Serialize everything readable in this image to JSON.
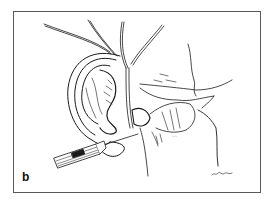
{
  "figure": {
    "panel_label": "b",
    "signature": "artist signature (illegible)",
    "annotation_near_vessels": "small illegible label",
    "colors": {
      "background": "#ffffff",
      "frame_border": "#5a5a5a",
      "ink": "#1a1a1a"
    }
  }
}
